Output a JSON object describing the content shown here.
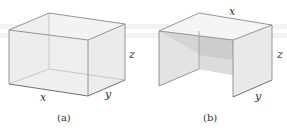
{
  "figures": [
    {
      "id": "a",
      "caption": "(a)",
      "description": "Open-top rectangular box (transparent)",
      "labels": {
        "x": "x",
        "y": "y",
        "z": "z"
      }
    },
    {
      "id": "b",
      "caption": "(b)",
      "description": "Box with top and two side panels (table shape)",
      "labels": {
        "x": "x",
        "y": "y",
        "z": "z"
      }
    }
  ],
  "colors": {
    "edge": "#8a8a8a",
    "face_light": "#f1f1f1",
    "face_mid": "#e2e2e2",
    "face_dark": "#cfcfcf"
  }
}
